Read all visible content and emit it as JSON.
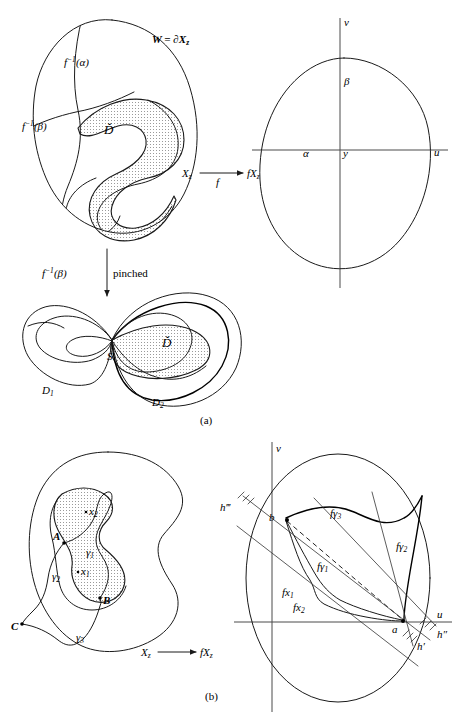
{
  "figure": {
    "caption_a": "(a)",
    "caption_b": "(b)",
    "panel_a": {
      "left_shape": {
        "boundary_label": "W = ∂X",
        "boundary_label_sub": "z",
        "curve_alpha_label": "f",
        "curve_alpha_sup": "−1",
        "curve_alpha_arg": "(α)",
        "curve_beta_label": "f",
        "curve_beta_sup": "−1",
        "curve_beta_arg": "(β)",
        "region_label": "Ď",
        "domain_label": "X",
        "domain_label_sub": "z"
      },
      "map_arrow": {
        "map_label": "f",
        "target_label": "fX",
        "target_label_sub": "z"
      },
      "right_shape": {
        "axis_v": "v",
        "axis_u": "u",
        "point_alpha": "α",
        "point_beta": "β",
        "point_y": "y"
      },
      "pinch_arrow": {
        "label_f": "f",
        "label_sup": "−1",
        "label_arg": "(β)",
        "label_word": "pinched"
      },
      "pinched_shape": {
        "node_label": "S",
        "lobe_left_label": "D",
        "lobe_left_sub": "1",
        "lobe_right_label": "D",
        "lobe_right_sub": "2",
        "region_label": "Ď"
      }
    },
    "panel_b": {
      "left_shape": {
        "point_A": "A",
        "point_B": "B",
        "point_C": "C",
        "point_x1": "x",
        "point_x1_sub": "1",
        "point_x2": "x",
        "point_x2_sub": "2",
        "gamma1": "γ",
        "gamma1_sub": "1",
        "gamma2": "γ",
        "gamma2_sub": "2",
        "gamma3": "γ",
        "gamma3_sub": "3",
        "domain_label": "X",
        "domain_label_sub": "z"
      },
      "map_arrow": {
        "source_label": "X",
        "source_label_sub": "z",
        "target_label": "fX",
        "target_label_sub": "z"
      },
      "right_shape": {
        "axis_v": "v",
        "axis_u": "u",
        "point_a": "a",
        "point_b": "b",
        "f_gamma1": "fγ",
        "f_gamma1_sub": "1",
        "f_gamma2": "fγ",
        "f_gamma2_sub": "2",
        "f_gamma3": "fγ",
        "f_gamma3_sub": "3",
        "fx1": "fx",
        "fx1_sub": "1",
        "fx2": "fx",
        "fx2_sub": "2",
        "h_prime": "h′",
        "h_double_prime": "h″",
        "h_triple_prime": "h‴"
      }
    }
  },
  "colors": {
    "ink": "#1a1a1a",
    "axis": "#4a4a4a",
    "shade": "#b9b9b9",
    "background": "#ffffff"
  }
}
